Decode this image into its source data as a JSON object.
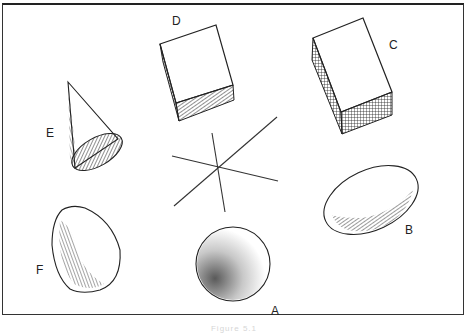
{
  "figure": {
    "caption": "Figure 5.1",
    "shapes": [
      {
        "id": "A",
        "label": "A",
        "type": "sphere"
      },
      {
        "id": "B",
        "label": "B",
        "type": "ellipsoid"
      },
      {
        "id": "C",
        "label": "C",
        "type": "rectangular-box"
      },
      {
        "id": "D",
        "label": "D",
        "type": "cube"
      },
      {
        "id": "E",
        "label": "E",
        "type": "cone"
      },
      {
        "id": "F",
        "label": "F",
        "type": "rounded-triangular-solid"
      }
    ],
    "center_element": {
      "type": "crossed-lines",
      "line_count": 3
    },
    "colors": {
      "ink": "#222222",
      "background": "#ffffff",
      "frame": "#333333"
    }
  }
}
